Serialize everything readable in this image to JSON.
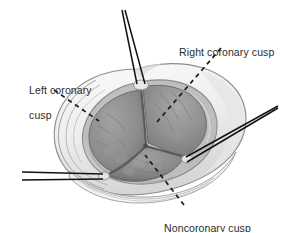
{
  "figure": {
    "type": "medical-illustration",
    "background_color": "#ffffff"
  },
  "labels": {
    "right_coronary": "Right coronary cusp",
    "left_coronary_line1": "Left coronary",
    "left_coronary_line2": "cusp",
    "noncoronary": "Noncoronary cusp"
  },
  "colors": {
    "label_text": "#2b2b2b",
    "leader_line": "#1a1a1a",
    "suture": "#111111",
    "outer_wall_light": "#f2f2f2",
    "outer_wall_mid": "#dcdcdc",
    "outer_wall_shadow": "#c2c2c2",
    "annulus_rim": "#b4b4b4",
    "cusp_fill": "#8e8e8e",
    "cusp_fill_dark": "#7a7a7a",
    "cusp_fill_light": "#a0a0a0",
    "coaptation_line": "#5a5a5a",
    "outline": "#6e6e6e"
  },
  "anatomy": {
    "cusp_count": 3,
    "cusp_names": [
      "Right coronary cusp",
      "Left coronary cusp",
      "Noncoronary cusp"
    ],
    "commissure_count": 3,
    "suture_pairs": 3
  }
}
